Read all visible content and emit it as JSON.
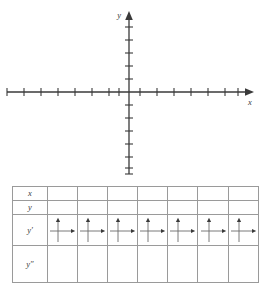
{
  "graph": {
    "name": "cartesian-coordinate-plane",
    "x_axis": {
      "label": "x",
      "ticks_left": 7,
      "ticks_right": 7,
      "arrow": "right",
      "tick_spacing_px": 17
    },
    "y_axis": {
      "label": "y",
      "ticks_up": 5,
      "ticks_down": 6,
      "arrow": "up",
      "tick_spacing_px": 13
    },
    "origin": {
      "x": 129,
      "y": 92
    },
    "axis_color": "#3a3a3a",
    "gridlines": false,
    "plotted_points": [],
    "curve": null
  },
  "table": {
    "name": "sign-analysis-table",
    "column_count": 8,
    "data_column_count": 7,
    "rows": [
      {
        "label": "x",
        "label_html": "x",
        "cells": [
          "",
          "",
          "",
          "",
          "",
          "",
          ""
        ],
        "cell_type": "blank"
      },
      {
        "label": "y",
        "label_html": "y",
        "cells": [
          "",
          "",
          "",
          "",
          "",
          "",
          ""
        ],
        "cell_type": "blank"
      },
      {
        "label": "y'",
        "label_html": "y′",
        "cells": [
          "axes-icon",
          "axes-icon",
          "axes-icon",
          "axes-icon",
          "axes-icon",
          "axes-icon",
          "axes-icon"
        ],
        "cell_type": "icon"
      },
      {
        "label": "y''",
        "label_html": "y″",
        "cells": [
          "",
          "",
          "",
          "",
          "",
          "",
          ""
        ],
        "cell_type": "blank"
      }
    ],
    "border_color": "#9a9a9a",
    "icon_name": "mini-axes-up-right-arrow-icon"
  }
}
